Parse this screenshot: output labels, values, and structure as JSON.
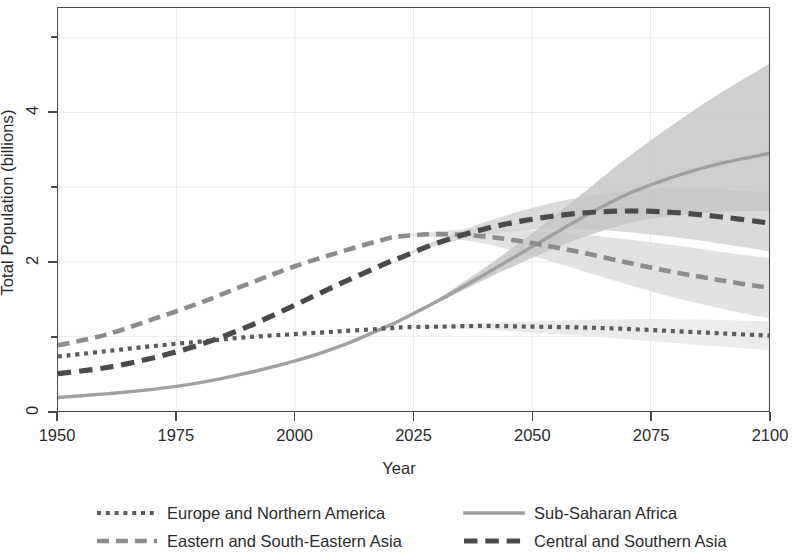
{
  "chart": {
    "type": "line",
    "title": "",
    "xlabel": "Year",
    "ylabel": "Total Population (billions)"
  },
  "axes": {
    "x_ticks": [
      "1950",
      "1975",
      "2000",
      "2025",
      "2050",
      "2075",
      "2100"
    ],
    "y_ticks_labeled": [
      "0",
      "2",
      "4"
    ],
    "y_ticks_minor": [
      "1",
      "3",
      "5"
    ],
    "xlim": [
      1950,
      2100
    ],
    "ylim": [
      0,
      5.4
    ]
  },
  "legend": {
    "position": "bottom",
    "entries": [
      {
        "label": "Europe and Northern America",
        "style": "dotted",
        "color": "#5a5a5a",
        "width": 4.2,
        "column": 1,
        "row": 1
      },
      {
        "label": "Sub-Saharan Africa",
        "style": "solid",
        "color": "#a0a0a0",
        "width": 3.4,
        "column": 2,
        "row": 1
      },
      {
        "label": "Eastern and South-Eastern Asia",
        "style": "dashed",
        "color": "#8c8c8c",
        "width": 4.6,
        "column": 1,
        "row": 2
      },
      {
        "label": "Central and Southern Asia",
        "style": "dashed",
        "color": "#4a4a4a",
        "width": 5.2,
        "column": 2,
        "row": 2
      }
    ]
  },
  "colors": {
    "frame": "#4a4a4a",
    "grid": "#ebebeb",
    "band_dark": "#bdbdbd",
    "band_light": "#dedede",
    "text": "#2b2b2b",
    "background": "#ffffff"
  },
  "chart_data": {
    "type": "line",
    "title": "",
    "xlabel": "Year",
    "ylabel": "Total Population (billions)",
    "xlim": [
      1950,
      2100
    ],
    "ylim": [
      0,
      5.4
    ],
    "grid": true,
    "legend_position": "bottom",
    "x": [
      1950,
      1960,
      1970,
      1980,
      1990,
      2000,
      2010,
      2020,
      2022,
      2030,
      2040,
      2050,
      2060,
      2070,
      2080,
      2090,
      2100
    ],
    "series": [
      {
        "name": "Europe and Northern America",
        "style": "dotted",
        "color": "#5a5a5a",
        "values": [
          0.73,
          0.8,
          0.87,
          0.93,
          0.99,
          1.03,
          1.07,
          1.11,
          1.12,
          1.13,
          1.14,
          1.13,
          1.12,
          1.1,
          1.07,
          1.04,
          1.01
        ],
        "band_low": [
          0.73,
          0.8,
          0.87,
          0.93,
          0.99,
          1.03,
          1.07,
          1.11,
          1.12,
          1.11,
          1.09,
          1.05,
          1.01,
          0.96,
          0.91,
          0.86,
          0.82
        ],
        "band_high": [
          0.73,
          0.8,
          0.87,
          0.93,
          0.99,
          1.03,
          1.07,
          1.11,
          1.12,
          1.15,
          1.18,
          1.2,
          1.22,
          1.23,
          1.23,
          1.22,
          1.2
        ]
      },
      {
        "name": "Eastern and South-Eastern Asia",
        "style": "dashed",
        "color": "#8c8c8c",
        "values": [
          0.88,
          1.02,
          1.23,
          1.45,
          1.7,
          1.94,
          2.14,
          2.32,
          2.34,
          2.37,
          2.34,
          2.25,
          2.13,
          1.99,
          1.86,
          1.75,
          1.65
        ],
        "band_low": [
          0.88,
          1.02,
          1.23,
          1.45,
          1.7,
          1.94,
          2.14,
          2.32,
          2.34,
          2.33,
          2.24,
          2.08,
          1.89,
          1.7,
          1.52,
          1.37,
          1.24
        ],
        "band_high": [
          0.88,
          1.02,
          1.23,
          1.45,
          1.7,
          1.94,
          2.14,
          2.32,
          2.35,
          2.41,
          2.44,
          2.42,
          2.37,
          2.3,
          2.22,
          2.13,
          2.05
        ]
      },
      {
        "name": "Central and Southern Asia",
        "style": "dashed",
        "color": "#4a4a4a",
        "values": [
          0.5,
          0.58,
          0.71,
          0.89,
          1.13,
          1.42,
          1.72,
          2.0,
          2.05,
          2.25,
          2.44,
          2.57,
          2.65,
          2.68,
          2.66,
          2.6,
          2.52
        ],
        "band_low": [
          0.5,
          0.58,
          0.71,
          0.89,
          1.13,
          1.42,
          1.72,
          2.0,
          2.05,
          2.22,
          2.36,
          2.43,
          2.44,
          2.4,
          2.33,
          2.24,
          2.14
        ],
        "band_high": [
          0.5,
          0.58,
          0.71,
          0.89,
          1.13,
          1.42,
          1.72,
          2.0,
          2.06,
          2.29,
          2.53,
          2.72,
          2.86,
          2.95,
          2.99,
          2.97,
          2.92
        ]
      },
      {
        "name": "Sub-Saharan Africa",
        "style": "solid",
        "color": "#a0a0a0",
        "values": [
          0.18,
          0.23,
          0.29,
          0.38,
          0.51,
          0.67,
          0.88,
          1.15,
          1.21,
          1.47,
          1.83,
          2.2,
          2.57,
          2.9,
          3.14,
          3.32,
          3.45
        ],
        "band_low": [
          0.18,
          0.23,
          0.29,
          0.38,
          0.51,
          0.67,
          0.88,
          1.15,
          1.21,
          1.45,
          1.76,
          2.05,
          2.31,
          2.51,
          2.62,
          2.67,
          2.68
        ],
        "band_high": [
          0.18,
          0.23,
          0.29,
          0.38,
          0.51,
          0.67,
          0.88,
          1.15,
          1.21,
          1.5,
          1.92,
          2.38,
          2.88,
          3.39,
          3.85,
          4.27,
          4.65
        ]
      }
    ],
    "annotations": []
  }
}
